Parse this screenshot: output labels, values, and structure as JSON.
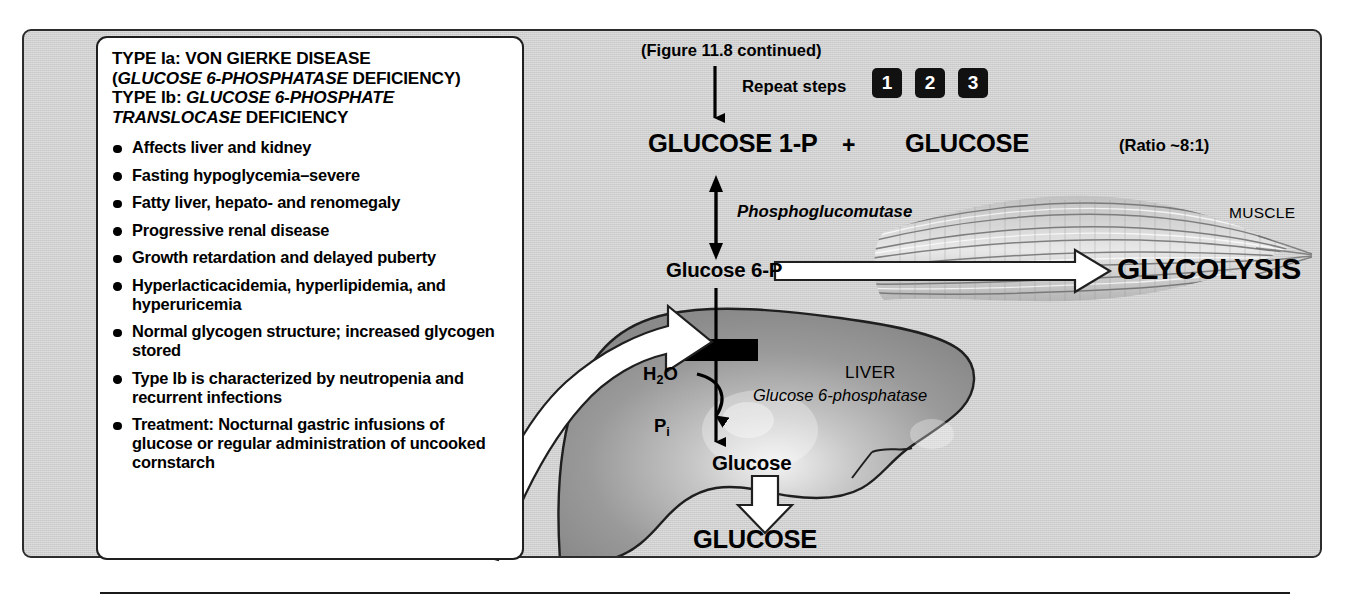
{
  "panel": {
    "background_color": "#cfcfcf",
    "border_color": "#2c2c2c"
  },
  "info_card": {
    "title_line1": "TYPE Ia: VON GIERKE DISEASE",
    "title_line2_open": "(",
    "title_line2_italic": "GLUCOSE 6-PHOSPHATASE",
    "title_line2_tail": " DEFICIENCY)",
    "title_line3_prefix": "TYPE Ib: ",
    "title_line3_italic": "GLUCOSE 6-PHOSPHATE",
    "title_line4_italic": "TRANSLOCASE",
    "title_line4_tail": " DEFICIENCY",
    "bullets": [
      "Affects liver and kidney",
      "Fasting hypoglycemia–severe",
      "Fatty liver, hepato- and renomegaly",
      "Progressive renal disease",
      "Growth retardation and delayed puberty",
      "Hyperlacticacidemia, hyperlipidemia, and hyperuricemia",
      "Normal glycogen structure; increased glycogen stored",
      "Type Ib is characterized by neutropenia and recurrent infections",
      "Treatment: Nocturnal gastric infusions of glucose or regular administration of uncooked cornstarch"
    ]
  },
  "pathway": {
    "figure_caption": "(Figure 11.8 continued)",
    "repeat_label": "Repeat steps",
    "step_badges": [
      "1",
      "2",
      "3"
    ],
    "glucose_1p": "GLUCOSE 1-P",
    "plus": "+",
    "glucose_top": "GLUCOSE",
    "ratio": "(Ratio ~8:1)",
    "phosphoglucomutase": "Phosphoglucomutase",
    "glucose_6p": "Glucose 6-P",
    "glycolysis": "GLYCOLYSIS",
    "muscle": "MUSCLE",
    "liver": "LIVER",
    "glucose_6_phosphatase": "Glucose 6-phosphatase",
    "water_main": "H",
    "water_sub": "2",
    "water_tail": "O",
    "phosphate_main": "P",
    "phosphate_sub": "i",
    "glucose_liver": "Glucose",
    "glucose_bottom": "GLUCOSE"
  }
}
